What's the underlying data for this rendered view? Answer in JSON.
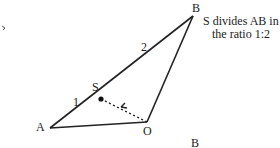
{
  "diagram": {
    "points": {
      "A": {
        "label": "A",
        "x": 50,
        "y": 128
      },
      "B": {
        "label": "B",
        "x": 193,
        "y": 16
      },
      "O": {
        "label": "O",
        "x": 147,
        "y": 122
      },
      "S": {
        "label": "S",
        "x": 101,
        "y": 99
      }
    },
    "segment_labels": {
      "AS": "1",
      "SB": "2"
    },
    "note_line1": "S divides AB in",
    "note_line2": "the ratio 1:2",
    "caption": "B",
    "colors": {
      "line": "#222222",
      "text": "#222222",
      "background": "#ffffff"
    }
  }
}
